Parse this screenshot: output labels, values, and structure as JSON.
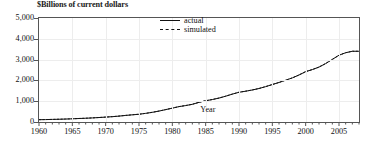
{
  "chart_data": {
    "type": "line",
    "title": "",
    "ylabel": "$Billions of current dollars",
    "xlabel": "Year",
    "ylim": [
      0,
      5000
    ],
    "xlim": [
      1960,
      2008
    ],
    "grid": true,
    "legend_position": "top-center",
    "ytick_labels": [
      "0",
      "1,000",
      "2,000",
      "3,000",
      "4,000",
      "5,000"
    ],
    "ytick_values": [
      0,
      1000,
      2000,
      3000,
      4000,
      5000
    ],
    "xtick_labels": [
      "1960",
      "1965",
      "1970",
      "1975",
      "1980",
      "1985",
      "1990",
      "1995",
      "2000",
      "2005"
    ],
    "xtick_values": [
      1960,
      1965,
      1970,
      1975,
      1980,
      1985,
      1990,
      1995,
      2000,
      2005
    ],
    "minor_xtick_interval": 1,
    "x": [
      1960,
      1961,
      1962,
      1963,
      1964,
      1965,
      1966,
      1967,
      1968,
      1969,
      1970,
      1971,
      1972,
      1973,
      1974,
      1975,
      1976,
      1977,
      1978,
      1979,
      1980,
      1981,
      1982,
      1983,
      1984,
      1985,
      1986,
      1987,
      1988,
      1989,
      1990,
      1991,
      1992,
      1993,
      1994,
      1995,
      1996,
      1997,
      1998,
      1999,
      2000,
      2001,
      2002,
      2003,
      2004,
      2005,
      2006,
      2007,
      2008
    ],
    "series": [
      {
        "name": "actual",
        "style": "solid",
        "color": "#111111",
        "values": [
          110,
          116,
          124,
          132,
          142,
          154,
          168,
          180,
          196,
          215,
          235,
          256,
          283,
          316,
          345,
          372,
          415,
          465,
          525,
          595,
          665,
          740,
          790,
          850,
          945,
          1020,
          1080,
          1150,
          1240,
          1340,
          1430,
          1480,
          1540,
          1610,
          1700,
          1800,
          1900,
          2010,
          2120,
          2260,
          2420,
          2520,
          2640,
          2810,
          3010,
          3210,
          3330,
          3400,
          3400
        ]
      },
      {
        "name": "simulated",
        "style": "dashed",
        "color": "#111111",
        "values": [
          112,
          118,
          125,
          133,
          143,
          155,
          169,
          182,
          197,
          216,
          236,
          258,
          285,
          318,
          347,
          374,
          417,
          467,
          527,
          597,
          667,
          742,
          792,
          852,
          947,
          1022,
          1082,
          1152,
          1242,
          1342,
          1432,
          1482,
          1542,
          1612,
          1702,
          1802,
          1902,
          2012,
          2122,
          2262,
          2422,
          2522,
          2642,
          2812,
          3012,
          3212,
          3332,
          3402,
          3402
        ]
      }
    ]
  },
  "legend": {
    "items": [
      {
        "label": "actual",
        "style": "solid"
      },
      {
        "label": "simulated",
        "style": "dashed"
      }
    ]
  },
  "axis": {
    "y_title": "$Billions of current dollars",
    "x_title": "Year"
  }
}
